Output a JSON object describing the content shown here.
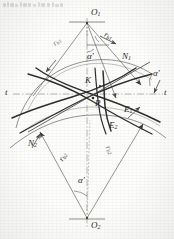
{
  "figure": {
    "kind": "involute-gear-meshing-geometry-diagram",
    "background_color": "#fdfdfc",
    "ink_color": "#3a3a37",
    "thin_ink_color": "#6f6f6c",
    "centers": {
      "upper": {
        "label": "O",
        "sub": "1"
      },
      "lower": {
        "label": "O",
        "sub": "2"
      }
    },
    "points": {
      "pitch_point": {
        "label": "P"
      },
      "contact_k": {
        "label": "K"
      },
      "limit_e1": {
        "label": "E",
        "sub": "1"
      },
      "limit_e2": {
        "label": "E",
        "sub": "2"
      }
    },
    "normals": {
      "n1": {
        "label": "N",
        "sub": "1"
      },
      "n2": {
        "label": "N",
        "sub": "2"
      }
    },
    "base_radii": {
      "rb1_upper_left": {
        "label": "r",
        "sub": "b1"
      },
      "rb1_upper_right": {
        "label": "r",
        "sub": "b1"
      },
      "rb2_lower_left": {
        "label": "r",
        "sub": "b2"
      },
      "rb2_lower_right": {
        "label": "r",
        "sub": "b2"
      }
    },
    "angles": {
      "alpha_top": "α′",
      "alpha_right": "α′",
      "alpha_bottom": "α′"
    },
    "tangent_line": {
      "left_label": "t",
      "right_label": "t"
    }
  }
}
